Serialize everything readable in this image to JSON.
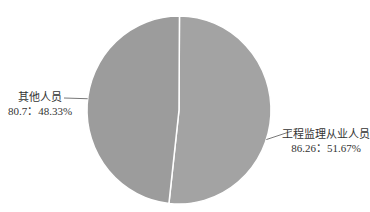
{
  "chart_data": {
    "type": "pie",
    "title": "",
    "slices": [
      {
        "name": "工程监理从业人员",
        "value": 86.26,
        "percent": 51.67,
        "label_line1": "工程监理从业人员",
        "label_line2": "86.26：51.67%"
      },
      {
        "name": "其他人员",
        "value": 80.7,
        "percent": 48.33,
        "label_line1": "其他人员",
        "label_line2": "80.7：48.33%"
      }
    ],
    "colors": [
      "#a3a3a3",
      "#9c9c9c"
    ],
    "separator_color": "#ffffff",
    "leader_color": "#555555",
    "legend": "none",
    "start": "top",
    "direction": "clockwise"
  }
}
